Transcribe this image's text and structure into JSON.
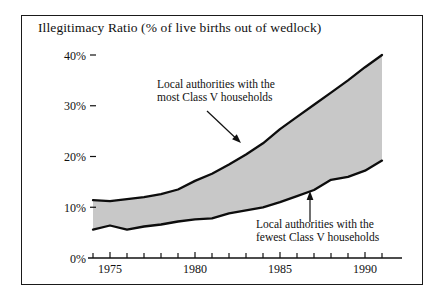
{
  "chart_data": {
    "type": "area",
    "title": "Illegitimacy Ratio (% of live births out of wedlock)",
    "xlabel": "",
    "ylabel": "",
    "xlim": [
      1973.5,
      1991.3
    ],
    "ylim": [
      0,
      44
    ],
    "grid": false,
    "legend_position": "none",
    "fill_color": "#c8c8c8",
    "line_color": "#0d0d0d",
    "frame_color": "#1a1a1a",
    "background_color": "#ffffff",
    "y_ticks": [
      0,
      10,
      20,
      30,
      40
    ],
    "y_tick_labels": [
      "0%",
      "10%",
      "20%",
      "30%",
      "40%"
    ],
    "x_ticks_major": [
      1975,
      1980,
      1985,
      1990
    ],
    "x_tick_labels": [
      "1975",
      "1980",
      "1985",
      "1990"
    ],
    "x_ticks_minor": [
      1974,
      1976,
      1977,
      1978,
      1979,
      1981,
      1982,
      1983,
      1984,
      1986,
      1987,
      1988,
      1989,
      1991
    ],
    "x": [
      1974,
      1975,
      1976,
      1977,
      1978,
      1979,
      1980,
      1981,
      1982,
      1983,
      1984,
      1985,
      1986,
      1987,
      1988,
      1989,
      1990,
      1991
    ],
    "series": [
      {
        "name": "Local authorities with the most Class V households",
        "values": [
          11.4,
          11.2,
          11.6,
          12.0,
          12.6,
          13.5,
          15.2,
          16.6,
          18.4,
          20.4,
          22.6,
          25.4,
          27.8,
          30.2,
          32.6,
          35.0,
          37.6,
          40.0
        ]
      },
      {
        "name": "Local authorities with the fewest Class V households",
        "values": [
          5.6,
          6.4,
          5.6,
          6.2,
          6.6,
          7.2,
          7.6,
          7.8,
          8.8,
          9.4,
          10.0,
          11.0,
          12.2,
          13.4,
          15.4,
          16.0,
          17.2,
          19.2
        ]
      }
    ],
    "annotations": [
      {
        "id": "upper",
        "lines": [
          "Local authorities with the",
          "most Class V households"
        ],
        "text_x": 157,
        "text_y": 88,
        "arrow_from": [
          207,
          111
        ],
        "arrow_to": [
          241,
          143
        ]
      },
      {
        "id": "lower",
        "lines": [
          "Local authorities with the",
          "fewest Class V households"
        ],
        "text_x": 256,
        "text_y": 228,
        "arrow_from": [
          310,
          222
        ],
        "arrow_to": [
          310,
          191
        ]
      }
    ]
  }
}
